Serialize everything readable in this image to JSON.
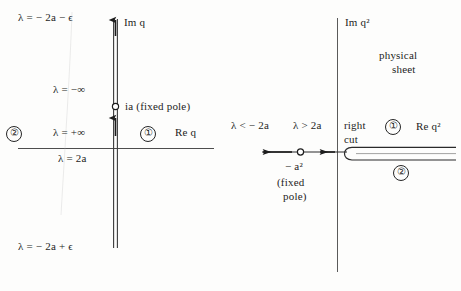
{
  "figure": {
    "type": "diagram",
    "background_color": "#fdfdfc",
    "ink_color": "#1d1d1d"
  },
  "left_panel": {
    "name": "q-plane",
    "axis_imag_label": "Im q",
    "axis_real_label": "Re q",
    "pole_label": "ia (fixed pole)",
    "sheet_labels": [
      {
        "id": "one",
        "text": "①"
      },
      {
        "id": "two",
        "text": "②"
      }
    ],
    "lambda_labels": [
      {
        "id": "top",
        "text": "λ = − 2a − ϵ"
      },
      {
        "id": "minus-inf",
        "text": "λ = −∞"
      },
      {
        "id": "plus-inf",
        "text": "λ = +∞"
      },
      {
        "id": "two-a",
        "text": "λ = 2a"
      },
      {
        "id": "bottom",
        "text": "λ = − 2a + ϵ"
      }
    ]
  },
  "right_panel": {
    "name": "q-squared-plane",
    "axis_imag_label": "Im q²",
    "axis_real_label": "Re q²",
    "physical_sheet_line1": "physical",
    "physical_sheet_line2": "sheet",
    "right_cut_line1": "right",
    "right_cut_line2": "cut",
    "pole_value": "− a²",
    "pole_note_line1": "(fixed",
    "pole_note_line2": "pole)",
    "sheet_labels": [
      {
        "id": "one",
        "text": "①"
      },
      {
        "id": "two",
        "text": "②"
      }
    ],
    "lambda_labels": [
      {
        "id": "less-than",
        "text": "λ < − 2a"
      },
      {
        "id": "greater-than",
        "text": "λ > 2a"
      }
    ]
  }
}
